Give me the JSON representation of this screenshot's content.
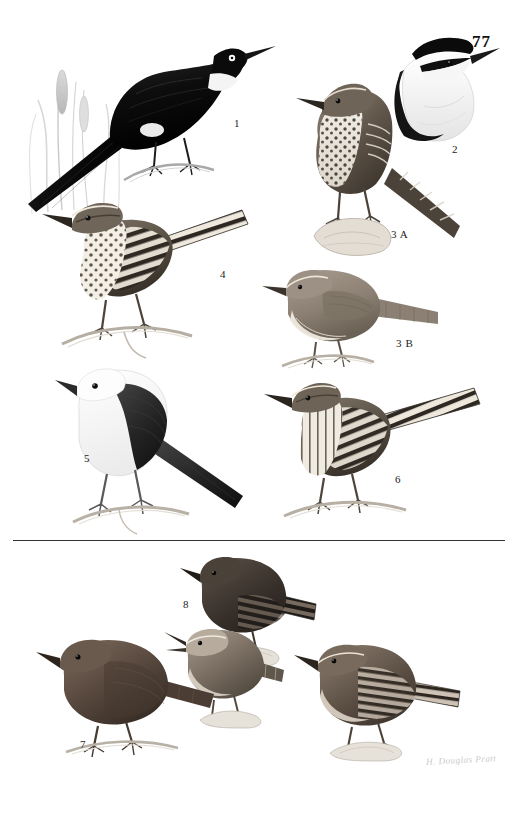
{
  "plate": {
    "number": "77",
    "signature": "H. Douglas Pratt"
  },
  "divider": {
    "present": true
  },
  "figures": [
    {
      "id": "fig-1",
      "label": "1",
      "label_x": 234,
      "label_y": 117,
      "description": "Large black-and-white wren perched on a reed stem with cattail foliage, long black tail angled down-left, white throat patch and white eye",
      "body_color": "#101010",
      "accent_color": "#f2f2f2",
      "x": 18,
      "y": 22,
      "w": 220,
      "h": 185
    },
    {
      "id": "fig-2",
      "label": "2",
      "label_x": 452,
      "label_y": 143,
      "description": "Head-and-breast portrait of a wren with bold black crown, broad white supercilium, black eyestripe and white underparts",
      "body_color": "#111111",
      "accent_color": "#f7f7f7",
      "x": 378,
      "y": 26,
      "w": 120,
      "h": 115
    },
    {
      "id": "fig-3a",
      "label": "3 A",
      "label_x": 391,
      "label_y": 228,
      "description": "Spotted wren with heavily spotted breast, barred wings and long barred tail, perched on a rock",
      "body_color": "#4a4138",
      "accent_color": "#efe9e0",
      "x": 288,
      "y": 72,
      "w": 175,
      "h": 185
    },
    {
      "id": "fig-3b",
      "label": "3 B",
      "label_x": 396,
      "label_y": 337,
      "description": "Plain buffy wren with unmarked underparts and grey-brown upperparts, perched on a twig",
      "body_color": "#8e8277",
      "accent_color": "#f1ece3",
      "x": 262,
      "y": 258,
      "w": 180,
      "h": 110
    },
    {
      "id": "fig-4",
      "label": "4",
      "label_x": 220,
      "label_y": 268,
      "description": "Boldly barred cactus wren with spotted breast and strongly barred back and tail, perched on a branch",
      "body_color": "#3c352d",
      "accent_color": "#f4f0e7",
      "x": 28,
      "y": 192,
      "w": 225,
      "h": 165
    },
    {
      "id": "fig-5",
      "label": "5",
      "label_x": 84,
      "label_y": 452,
      "description": "White-headed wren with pure white head and underparts and dark blackish back, wings and tail, perched on a branch",
      "body_color": "#2a2a2a",
      "accent_color": "#fcfcfc",
      "x": 55,
      "y": 358,
      "w": 200,
      "h": 175
    },
    {
      "id": "fig-6",
      "label": "6",
      "label_x": 395,
      "label_y": 473,
      "description": "Barred wren with finely streaked breast and strongly barred back and long barred tail cocked upward",
      "body_color": "#4a4238",
      "accent_color": "#f2ece2",
      "x": 258,
      "y": 370,
      "w": 230,
      "h": 150
    },
    {
      "id": "fig-7",
      "label": "7",
      "label_x": 80,
      "label_y": 738,
      "description": "Plain dark rufous-brown wren perched on a branch, uniform coloration, short tail",
      "body_color": "#54453b",
      "accent_color": "#6d5c50",
      "x": 38,
      "y": 630,
      "w": 180,
      "h": 125
    },
    {
      "id": "fig-8",
      "label": "8",
      "label_x": 183,
      "label_y": 598,
      "description": "Dark sooty wren with barred flanks and barred tail, perched on a mossy stub",
      "body_color": "#3a322c",
      "accent_color": "#5b5048",
      "x": 180,
      "y": 548,
      "w": 140,
      "h": 115
    },
    {
      "id": "fig-8b",
      "label": "",
      "label_x": 0,
      "label_y": 0,
      "description": "Pale-faced wren with open bill singing, perched on a mossy stub below figure 8",
      "body_color": "#7a6d61",
      "accent_color": "#ded5c9",
      "x": 168,
      "y": 620,
      "w": 120,
      "h": 105
    },
    {
      "id": "fig-9",
      "label": "9",
      "label_x": 411,
      "label_y": 729,
      "description": "Brown wren with barred wings and tail, pale eyebrow, perched on a mossy stub",
      "body_color": "#5d5046",
      "accent_color": "#cdc2b4",
      "x": 296,
      "y": 635,
      "w": 175,
      "h": 125
    }
  ]
}
